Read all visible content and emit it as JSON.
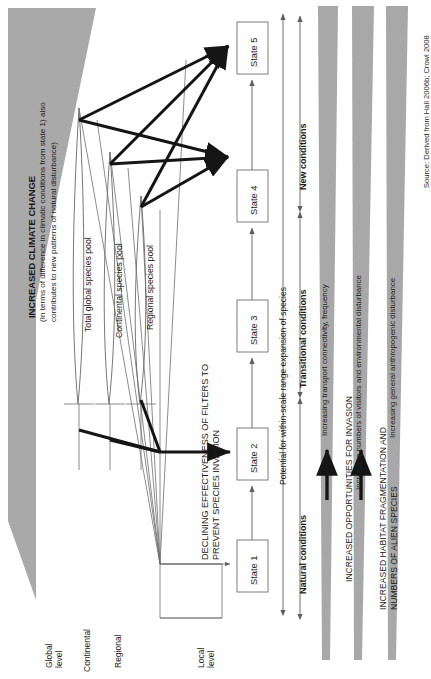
{
  "figure": {
    "title_main": "INCREASED CLIMATE CHANGE",
    "title_sub_line1": "(In terms of difference in climatic conditions from state 1) also",
    "title_sub_line2": "contributes to new patterns of natural disturbance)",
    "source": "Source: Derived from Hall 2006b; Crowl 2008"
  },
  "scale_axis": {
    "label": "Spatial scale levels",
    "levels": [
      {
        "id": "global",
        "line1": "Global",
        "line2": "level"
      },
      {
        "id": "continental",
        "line1": "Continental",
        "line2": ""
      },
      {
        "id": "regional",
        "line1": "Regional",
        "line2": ""
      },
      {
        "id": "local",
        "line1": "Local",
        "line2": "level"
      }
    ]
  },
  "species_pools": [
    {
      "id": "global-pool",
      "label": "Total global species pool"
    },
    {
      "id": "continental-pool",
      "label": "Continental species pool"
    },
    {
      "id": "regional-pool",
      "label": "Regional species pool"
    }
  ],
  "filters": {
    "line1": "DECLINING EFFECTIVENESS OF FILTERS TO",
    "line2": "PREVENT SPECIES INVASION"
  },
  "states": [
    {
      "id": "state-1",
      "label": "State 1"
    },
    {
      "id": "state-2",
      "label": "State 2"
    },
    {
      "id": "state-3",
      "label": "State 3"
    },
    {
      "id": "state-4",
      "label": "State 4"
    },
    {
      "id": "state-5",
      "label": "State 5"
    }
  ],
  "potential_axis": {
    "label": "Potential for within-scale range expansion of species"
  },
  "conditions": [
    {
      "id": "natural",
      "label": "Natural conditions"
    },
    {
      "id": "transitional",
      "label": "Transitional conditions"
    },
    {
      "id": "new",
      "label": "New conditions"
    }
  ],
  "wedges": [
    {
      "id": "wedge-transport",
      "gradient_label": "Increasing transport connectivity, frequency",
      "heading_line1": "INCREASED OPPORTUNITIES FOR INVASION",
      "heading_line2": "",
      "has_arrow": true
    },
    {
      "id": "wedge-visitors",
      "gradient_label": "Increasing numbers of visitors and environmental disturbance",
      "heading_line1": "INCREASED HABITAT FRAGMENTATION AND",
      "heading_line2": "NUMBERS OF ALIEN SPECIES",
      "has_arrow": true
    },
    {
      "id": "wedge-anthropogenic",
      "gradient_label": "Increasing general anthropogenic disturbance",
      "heading_line1": "",
      "heading_line2": "",
      "has_arrow": false
    }
  ],
  "colors": {
    "wedge_gray": "#a8a8a8",
    "climate_gray": "#a9a9a9",
    "line_gray": "#6f6f6f",
    "heavy_line": "#151515",
    "box_border": "#7d7d7d",
    "text": "#1a1a1a",
    "background": "#ffffff"
  }
}
